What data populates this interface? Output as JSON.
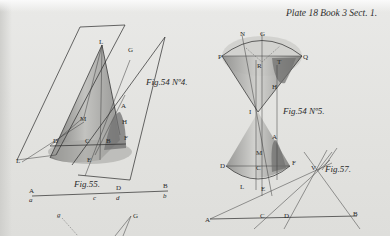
{
  "plate": {
    "title": "Plate 18 Book 3 Sect. 1."
  },
  "figures": [
    {
      "id": "fig54-4",
      "caption": "Fig.54 Nº4.",
      "labels": [
        "L",
        "G",
        "M",
        "A",
        "H",
        "D",
        "C",
        "B",
        "F",
        "E",
        "L"
      ]
    },
    {
      "id": "fig54-5",
      "caption": "Fig.54 Nº5.",
      "labels": [
        "N",
        "G",
        "P",
        "Q",
        "R",
        "T",
        "H",
        "I",
        "A",
        "M",
        "D",
        "C",
        "F",
        "L",
        "E"
      ]
    },
    {
      "id": "fig55",
      "caption": "Fig.55.",
      "labels": [
        "A",
        "D",
        "B",
        "a",
        "c",
        "d",
        "b"
      ]
    },
    {
      "id": "fig57",
      "caption": "Fig.57.",
      "labels": [
        "V",
        "A",
        "C",
        "D",
        "B"
      ]
    },
    {
      "id": "fig56-partial",
      "caption": "",
      "labels": [
        "g",
        "G"
      ]
    }
  ],
  "colors": {
    "paper": "#e6e6e4",
    "ink": "#2a2a2a",
    "shade": "#8a8a88"
  }
}
